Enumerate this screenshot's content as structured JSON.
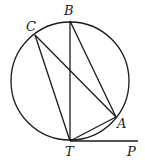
{
  "diagram": {
    "type": "geometry",
    "circle": {
      "cx": 70,
      "cy": 81,
      "r": 59
    },
    "points": {
      "B": {
        "x": 70,
        "y": 21,
        "label": "B",
        "lx": 64,
        "ly": 15
      },
      "C": {
        "x": 35,
        "y": 35,
        "label": "C",
        "lx": 26,
        "ly": 31
      },
      "A": {
        "x": 116,
        "y": 117,
        "label": "A",
        "lx": 117,
        "ly": 128
      },
      "T": {
        "x": 70,
        "y": 141,
        "label": "T",
        "lx": 65,
        "ly": 156
      },
      "P": {
        "x": 138,
        "y": 141,
        "label": "P",
        "lx": 127,
        "ly": 156
      }
    },
    "segments": [
      [
        "B",
        "T"
      ],
      [
        "B",
        "A"
      ],
      [
        "C",
        "A"
      ],
      [
        "C",
        "T"
      ],
      [
        "T",
        "A"
      ],
      [
        "T",
        "P"
      ]
    ]
  }
}
